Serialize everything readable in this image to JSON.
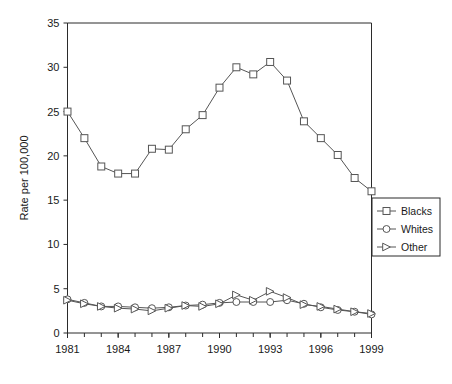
{
  "chart_data": {
    "type": "line",
    "title": "",
    "xlabel": "",
    "ylabel": "Rate per 100,000",
    "x": [
      1981,
      1982,
      1983,
      1984,
      1985,
      1986,
      1987,
      1988,
      1989,
      1990,
      1991,
      1992,
      1993,
      1994,
      1995,
      1996,
      1997,
      1998,
      1999
    ],
    "xlim": [
      1981,
      1999
    ],
    "ylim": [
      0,
      35
    ],
    "ytick_labels": [
      "0",
      "5",
      "10",
      "15",
      "20",
      "25",
      "30",
      "35"
    ],
    "ytick_values": [
      0,
      5,
      10,
      15,
      20,
      25,
      30,
      35
    ],
    "xtick_labels": [
      "1981",
      "1984",
      "1987",
      "1990",
      "1993",
      "1996",
      "1999"
    ],
    "xtick_values": [
      1981,
      1984,
      1987,
      1990,
      1993,
      1996,
      1999
    ],
    "xtick_minor_values": [
      1982,
      1983,
      1985,
      1986,
      1988,
      1989,
      1991,
      1992,
      1994,
      1995,
      1997,
      1998
    ],
    "grid": false,
    "legend_position": "right-middle",
    "series": [
      {
        "name": "Blacks",
        "marker": "square",
        "color": "#555555",
        "values": [
          25.0,
          22.0,
          18.8,
          18.0,
          18.0,
          20.8,
          20.7,
          23.0,
          24.6,
          27.7,
          30.0,
          29.2,
          30.6,
          28.5,
          23.9,
          22.0,
          20.1,
          17.5,
          16.0
        ]
      },
      {
        "name": "Whites",
        "marker": "circle",
        "color": "#555555",
        "values": [
          3.8,
          3.4,
          3.0,
          3.0,
          2.9,
          2.8,
          2.9,
          3.1,
          3.2,
          3.4,
          3.5,
          3.5,
          3.5,
          3.7,
          3.3,
          2.9,
          2.6,
          2.4,
          2.1
        ]
      },
      {
        "name": "Other",
        "marker": "triangle",
        "color": "#555555",
        "values": [
          3.7,
          3.3,
          3.0,
          2.8,
          2.7,
          2.5,
          2.8,
          3.1,
          3.0,
          3.3,
          4.3,
          3.7,
          4.7,
          4.0,
          3.2,
          3.0,
          2.7,
          2.4,
          2.2
        ]
      }
    ]
  },
  "legend": {
    "items": [
      {
        "label": "Blacks",
        "marker": "square"
      },
      {
        "label": "Whites",
        "marker": "circle"
      },
      {
        "label": "Other",
        "marker": "triangle"
      }
    ]
  },
  "colors": {
    "axis": "#2b2b2b",
    "line": "#555555",
    "text": "#1a1a1a",
    "background": "#ffffff"
  }
}
